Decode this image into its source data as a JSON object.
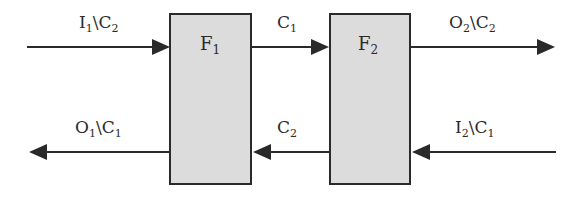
{
  "diagram": {
    "colors": {
      "line": "#2a2a2a",
      "box_fill": "#dcdcdc",
      "box_stroke": "#2a2a2a"
    },
    "boxes": [
      {
        "id": "F1",
        "name": "F",
        "sub": "1"
      },
      {
        "id": "F2",
        "name": "F",
        "sub": "2"
      }
    ],
    "arrows": [
      {
        "id": "in-left-top",
        "main": "I",
        "sub1": "1",
        "sep": "\\",
        "c": "C",
        "sub2": "2",
        "direction": "right"
      },
      {
        "id": "F1-to-F2",
        "main": "C",
        "sub1": "1",
        "direction": "right"
      },
      {
        "id": "out-right-top",
        "main": "O",
        "sub1": "2",
        "sep": "\\",
        "c": "C",
        "sub2": "2",
        "direction": "right"
      },
      {
        "id": "out-left-bottom",
        "main": "O",
        "sub1": "1",
        "sep": "\\",
        "c": "C",
        "sub2": "1",
        "direction": "left"
      },
      {
        "id": "F2-to-F1",
        "main": "C",
        "sub1": "2",
        "direction": "left"
      },
      {
        "id": "in-right-bottom",
        "main": "I",
        "sub1": "2",
        "sep": "\\",
        "c": "C",
        "sub2": "1",
        "direction": "left"
      }
    ]
  }
}
